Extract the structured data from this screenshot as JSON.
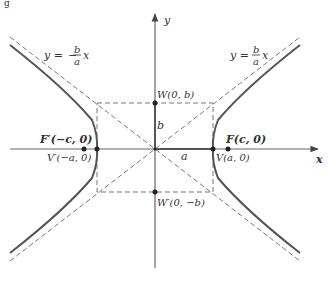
{
  "figure": {
    "caption_fragment": "g",
    "axes": {
      "x_label": "x",
      "y_label": "y"
    },
    "asymptotes": {
      "left": {
        "y": "y =",
        "sign": "−",
        "num": "b",
        "den": "a",
        "x": "x"
      },
      "right": {
        "y": "y =",
        "sign": "",
        "num": "b",
        "den": "a",
        "x": "x"
      }
    },
    "points": {
      "focus_left": "F′(−c, 0)",
      "vertex_left": "V′(−a, 0)",
      "vertex_right": "V(a, 0)",
      "focus_right": "F(c, 0)",
      "co_vertex_top": "W(0, b)",
      "co_vertex_bottom": "W′(0, −b)"
    },
    "segments": {
      "semi_minor": "b",
      "semi_major": "a"
    },
    "colors": {
      "curve": "#555555",
      "axes": "#666666",
      "dashed": "#777777",
      "text": "#333333"
    }
  }
}
